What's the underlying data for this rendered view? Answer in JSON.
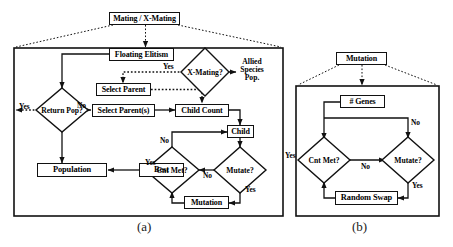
{
  "figure": {
    "panels": [
      {
        "id": "a",
        "caption": "(a)",
        "title_box": "Mating / X-Mating",
        "nodes": [
          {
            "name": "floating-elitism",
            "label": "Floating Elitism",
            "shape": "rect"
          },
          {
            "name": "x-mating-decision",
            "label": "X-Mating?",
            "shape": "diamond"
          },
          {
            "name": "allied-species-pop",
            "label": "Allied\nSpecies\nPop.",
            "shape": "text"
          },
          {
            "name": "select-parent",
            "label": "Select Parent",
            "shape": "rect"
          },
          {
            "name": "select-parents",
            "label": "Select Parent(s)",
            "shape": "rect"
          },
          {
            "name": "child-count",
            "label": "Child Count",
            "shape": "rect"
          },
          {
            "name": "child",
            "label": "Child",
            "shape": "rect"
          },
          {
            "name": "return-pop-decision",
            "label": "Return Pop?",
            "shape": "diamond"
          },
          {
            "name": "population",
            "label": "Population",
            "shape": "rect"
          },
          {
            "name": "best",
            "label": "Best",
            "shape": "rect"
          },
          {
            "name": "cnt-met-decision",
            "label": "Cnt Met?",
            "shape": "diamond"
          },
          {
            "name": "mutate-decision",
            "label": "Mutate?",
            "shape": "diamond"
          },
          {
            "name": "mutation",
            "label": "Mutation",
            "shape": "rect"
          }
        ],
        "edge_labels": [
          {
            "name": "x-mating-yes",
            "label": "Yes"
          },
          {
            "name": "return-pop-yes",
            "label": "Yes"
          },
          {
            "name": "return-pop-no",
            "label": "No"
          },
          {
            "name": "cnt-met-no",
            "label": "No"
          },
          {
            "name": "cnt-met-yes",
            "label": "Yes"
          },
          {
            "name": "mutate-no",
            "label": "No"
          },
          {
            "name": "mutate-yes",
            "label": "Yes"
          }
        ]
      },
      {
        "id": "b",
        "caption": "(b)",
        "title_box": "Mutation",
        "nodes": [
          {
            "name": "num-genes",
            "label": "# Genes",
            "shape": "rect"
          },
          {
            "name": "cnt-met-decision",
            "label": "Cnt Met?",
            "shape": "diamond"
          },
          {
            "name": "mutate-decision",
            "label": "Mutate?",
            "shape": "diamond"
          },
          {
            "name": "random-swap",
            "label": "Random Swap",
            "shape": "rect"
          }
        ],
        "edge_labels": [
          {
            "name": "cnt-met-yes",
            "label": "Yes"
          },
          {
            "name": "mutate-no-top",
            "label": "No"
          },
          {
            "name": "cnt-met-no",
            "label": "No"
          },
          {
            "name": "mutate-yes",
            "label": "Yes"
          }
        ]
      }
    ],
    "colors": {
      "stroke": "#111111",
      "text": "#000000",
      "background": "#ffffff"
    }
  },
  "a": {
    "title": "Mating / X-Mating",
    "floating_elitism": "Floating Elitism",
    "x_mating": "X-Mating?",
    "allied_1": "Allied",
    "allied_2": "Species",
    "allied_3": "Pop.",
    "select_parent": "Select Parent",
    "select_parents": "Select Parent(s)",
    "child_count": "Child Count",
    "child": "Child",
    "return_pop": "Return Pop?",
    "population": "Population",
    "best": "Best",
    "cnt_met": "Cnt Met?",
    "mutate": "Mutate?",
    "mutation": "Mutation",
    "lbl_xmating_yes": "Yes",
    "lbl_return_yes": "Yes",
    "lbl_return_no": "No",
    "lbl_cntmet_no": "No",
    "lbl_cntmet_yes": "Yes",
    "lbl_mutate_no": "No",
    "lbl_mutate_yes": "Yes",
    "caption": "(a)"
  },
  "b": {
    "title": "Mutation",
    "num_genes": "# Genes",
    "cnt_met": "Cnt Met?",
    "mutate": "Mutate?",
    "random_swap": "Random Swap",
    "lbl_cntmet_yes": "Yes",
    "lbl_mutate_no": "No",
    "lbl_cntmet_no": "No",
    "lbl_mutate_yes": "Yes",
    "caption": "(b)"
  }
}
